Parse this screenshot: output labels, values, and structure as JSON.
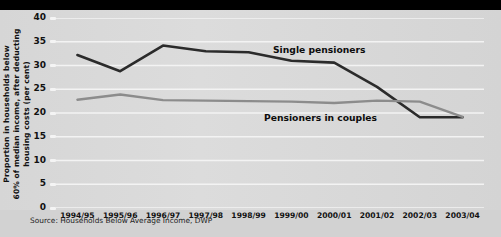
{
  "chart_data": {
    "type": "line",
    "title": "",
    "xlabel": "",
    "ylabel": "Proportion in households below 60% of median income, after deducting housing costs (per cent)",
    "ylabel_lines": [
      "Proportion in households below",
      "60% of median income, after deducting",
      "housing costs (per cent)"
    ],
    "categories": [
      "1994/95",
      "1995/96",
      "1996/97",
      "1997/98",
      "1998/99",
      "1999/00",
      "2000/01",
      "2001/02",
      "2002/03",
      "2003/04"
    ],
    "yticks": [
      0,
      5,
      10,
      15,
      20,
      25,
      30,
      35,
      40
    ],
    "ylim": [
      0,
      40
    ],
    "grid": true,
    "legend": "inline-annotations",
    "series": [
      {
        "name": "Single pensioners",
        "color": "#2b2b2b",
        "values": [
          32.2,
          28.8,
          34.2,
          33.0,
          32.8,
          31.0,
          30.6,
          25.5,
          19.1,
          19.1
        ]
      },
      {
        "name": "Pensioners in couples",
        "color": "#8c8c8c",
        "values": [
          22.8,
          23.9,
          22.7,
          22.6,
          22.5,
          22.4,
          22.1,
          22.6,
          22.4,
          19.2
        ]
      }
    ],
    "annotations": [
      {
        "text": "Single pensioners"
      },
      {
        "text": "Pensioners in couples"
      }
    ]
  },
  "source": {
    "text": "Source: Households Below Average Income, DWP"
  },
  "colors": {
    "background": "#000000",
    "panel": "#d9d9d9",
    "grid": "#f2f2f2",
    "single_pensioners": "#2b2b2b",
    "pensioners_in_couples": "#8c8c8c",
    "text": "#111111"
  }
}
